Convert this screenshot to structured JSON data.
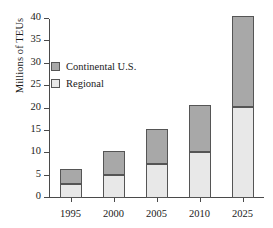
{
  "chart_data": {
    "type": "bar",
    "subtype": "stacked-vertical",
    "title": "",
    "xlabel": "",
    "ylabel": "Millions of TEUs",
    "categories": [
      "1995",
      "2000",
      "2005",
      "2010",
      "2025"
    ],
    "series": [
      {
        "name": "Regional",
        "color": "#e8e8e8",
        "values": [
          3.2,
          5.2,
          7.5,
          10.2,
          20.3
        ]
      },
      {
        "name": "Continental U.S.",
        "color": "#a8a8a8",
        "values": [
          3.2,
          5.3,
          7.9,
          10.5,
          20.4
        ]
      }
    ],
    "totals": [
      6.4,
      10.5,
      15.4,
      20.7,
      40.7
    ],
    "ylim": [
      0,
      40
    ],
    "yticks": [
      0,
      5,
      10,
      15,
      20,
      25,
      30,
      35,
      40
    ],
    "ytick_labels": [
      "0",
      "5",
      "10",
      "15",
      "20",
      "25",
      "30",
      "35",
      "40"
    ],
    "grid": false,
    "legend_position": "upper-left",
    "legend_order": [
      "Continental U.S.",
      "Regional"
    ]
  }
}
